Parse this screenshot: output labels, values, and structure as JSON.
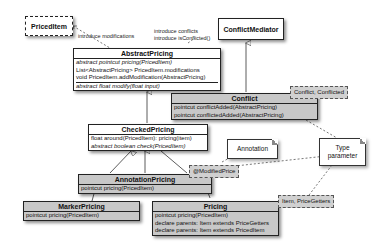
{
  "diagram": {
    "type": "UML class diagram",
    "classes": {
      "priced_item": {
        "name": "PricedItem"
      },
      "conflict_mediator": {
        "name": "ConflictMediator"
      },
      "abstract_pricing": {
        "name": "AbstractPricing",
        "members": [
          "abstract pointcut pricing(PricedItem)",
          "List<AbstractPricing> PricedItem.modifications",
          "void PricedItem.addModification(AbstractPricing)",
          "abstract float modify(float input)"
        ]
      },
      "conflict": {
        "name": "Conflict",
        "members": [
          "pointcut conflictAdded(AbstractPricing)",
          "pointcut conflictedAdded(AbstractPricing)"
        ]
      },
      "checked_pricing": {
        "name": "CheckedPricing",
        "members": [
          "float around(PricedItem): pricing(item)",
          "abstract boolean check(PricedItem)"
        ]
      },
      "annotation_pricing": {
        "name": "AnnotationPricing",
        "members": [
          "pointcut pricing(PricedItem)"
        ]
      },
      "marker_pricing": {
        "name": "MarkerPricing",
        "members": [
          "pointcut pricing(PricedItem)"
        ]
      },
      "pricing": {
        "name": "Pricing",
        "members": [
          "pointcut pricing(PricedItem)",
          "declare parents: Item extends PriceGetters",
          "declare parents: Item extends PricedItem"
        ]
      }
    },
    "labels": {
      "introduce_modifications": "introduce modifications",
      "introduce_conflicts_1": "introduce conflicts",
      "introduce_conflicts_2": "introduce isConflicted()"
    },
    "template_params": {
      "conflict_params": "Conflict, Conflicted",
      "modified_price": "@ModifiedPrice",
      "item_params": "Item, PriceGetters"
    },
    "notes": {
      "annotation": "Annotation",
      "type_parameter_1": "Type",
      "type_parameter_2": "parameter"
    },
    "colors": {
      "class_fill": "#ffffff",
      "class_fill_gray": "#c8c8c8",
      "param_fill": "#d0d0d0",
      "line": "#333333"
    }
  }
}
